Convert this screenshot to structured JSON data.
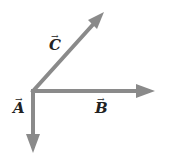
{
  "diagram": {
    "type": "vector-diagram",
    "origin": [
      33,
      91
    ],
    "stroke_color": "#8a8a8a",
    "vectors": [
      {
        "name": "A",
        "label": "A",
        "arrow": "→",
        "direction": "down",
        "end": [
          33,
          152
        ],
        "label_pos": [
          13,
          108
        ]
      },
      {
        "name": "B",
        "label": "B",
        "arrow": "→",
        "direction": "right",
        "end": [
          154,
          91
        ],
        "label_pos": [
          95,
          108
        ]
      },
      {
        "name": "C",
        "label": "C",
        "arrow": "→",
        "direction": "up-right (45°)",
        "end": [
          103,
          13
        ],
        "label_pos": [
          48,
          35
        ]
      }
    ]
  }
}
